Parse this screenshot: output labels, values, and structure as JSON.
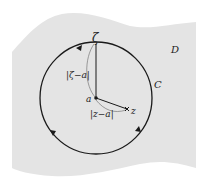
{
  "diagram": {
    "region_label": "D",
    "contour_label": "C",
    "center_label": "a",
    "boundary_point_label": "ζ",
    "interior_point_label": "z",
    "radius_label": "|ζ−a|",
    "distance_label": "|z−a|"
  },
  "colors": {
    "region_fill": "#e4e4e4",
    "stroke": "#1a1a1a",
    "background": "#ffffff"
  }
}
